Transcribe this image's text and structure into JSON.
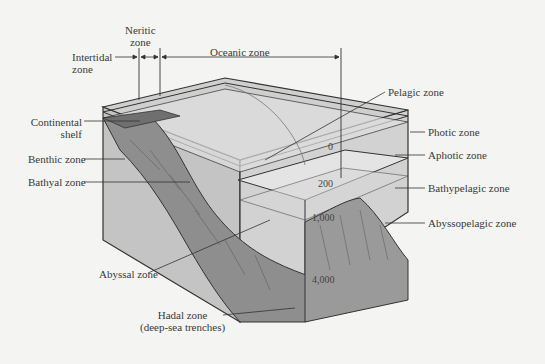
{
  "diagram": {
    "top_labels": {
      "intertidal": [
        "Intertidal",
        "zone"
      ],
      "neritic": [
        "Neritic",
        "zone"
      ],
      "oceanic": "Oceanic zone"
    },
    "left_labels": {
      "continental_shelf": [
        "Continental",
        "shelf"
      ],
      "benthic": "Benthic zone",
      "bathyal": "Bathyal zone",
      "abyssal": "Abyssal zone",
      "hadal": [
        "Hadal zone",
        "(deep-sea trenches)"
      ]
    },
    "right_labels": {
      "pelagic": "Pelagic zone",
      "photic": "Photic zone",
      "aphotic": "Aphotic zone",
      "bathypelagic": "Bathypelagic zone",
      "abyssopelagic": "Abyssopelagic zone"
    },
    "depths": [
      "0",
      "200",
      "1,000",
      "4,000"
    ],
    "colors": {
      "background": "#f4f4f2",
      "top_surface": "#c8c8c8",
      "side_face": "#bdbdbd",
      "seafloor": "#8c8c8c",
      "outline": "#333333"
    }
  }
}
